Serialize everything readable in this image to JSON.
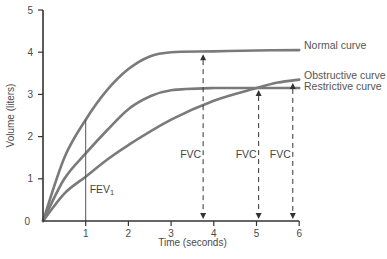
{
  "chart_data": {
    "type": "line",
    "title": "",
    "xlabel": "Time (seconds)",
    "ylabel": "Volume (liters)",
    "xlim": [
      0,
      6
    ],
    "ylim": [
      0,
      5
    ],
    "xticks": [
      "1",
      "2",
      "3",
      "4",
      "5",
      "6"
    ],
    "yticks": [
      "0",
      "1",
      "2",
      "3",
      "4",
      "5"
    ],
    "grid": false,
    "legend_position": "right (inline labels)",
    "series": [
      {
        "name": "Normal curve",
        "x": [
          0,
          0.5,
          1,
          1.5,
          2,
          2.5,
          3,
          4,
          5,
          6
        ],
        "values": [
          0,
          1.5,
          2.4,
          3.1,
          3.6,
          3.9,
          4.0,
          4.02,
          4.04,
          4.05
        ]
      },
      {
        "name": "Obstructive curve",
        "x": [
          0,
          0.5,
          1,
          1.5,
          2,
          3,
          4,
          5,
          5.5,
          6
        ],
        "values": [
          0,
          0.65,
          1.05,
          1.45,
          1.8,
          2.4,
          2.85,
          3.15,
          3.28,
          3.35
        ]
      },
      {
        "name": "Restrictive curve",
        "x": [
          0,
          0.5,
          1,
          1.5,
          2,
          2.5,
          3,
          4,
          5,
          6
        ],
        "values": [
          0,
          1.0,
          1.6,
          2.15,
          2.65,
          2.95,
          3.1,
          3.15,
          3.15,
          3.15
        ]
      }
    ],
    "annotations": [
      {
        "text": "FEV",
        "subscript": "1",
        "x": 1,
        "note": "vertical line at t=1 s"
      },
      {
        "text": "FVC",
        "x": 3.75,
        "note": "dashed double arrow from 0 to normal plateau (4.0)"
      },
      {
        "text": "FVC",
        "x": 5.05,
        "note": "dashed arrow from 0 to restrictive plateau (3.15)"
      },
      {
        "text": "FVC",
        "x": 5.85,
        "note": "dashed arrow from 0 to obstructive curve (~3.3)"
      }
    ],
    "colors": {
      "curve": "#7a7a7a",
      "axis": "#333333",
      "text": "#4a4a4a"
    }
  }
}
